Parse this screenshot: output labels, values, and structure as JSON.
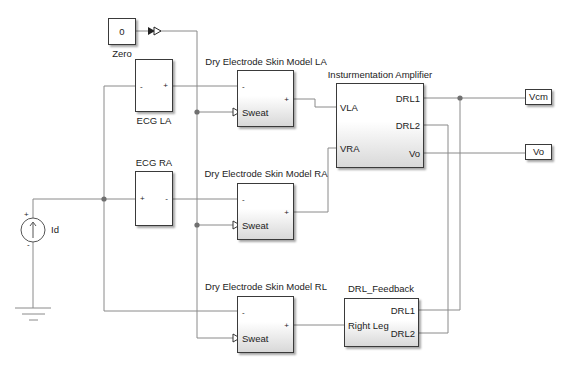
{
  "blocks": {
    "zero": {
      "value": "0",
      "label": "Zero"
    },
    "ecg_la": {
      "label": "ECG LA",
      "port_left": "-",
      "port_right": "+"
    },
    "ecg_ra": {
      "label": "ECG RA",
      "port_left": "+",
      "port_right": "-"
    },
    "dry_la": {
      "label": "Dry Electrode Skin Model LA",
      "port_minus": "-",
      "port_plus": "+",
      "port_sweat": "Sweat"
    },
    "dry_ra": {
      "label": "Dry Electrode Skin Model RA",
      "port_minus": "-",
      "port_plus": "+",
      "port_sweat": "Sweat"
    },
    "dry_rl": {
      "label": "Dry Electrode Skin Model RL",
      "port_minus": "-",
      "port_plus": "+",
      "port_sweat": "Sweat"
    },
    "amp": {
      "label": "Insturmentation Amplifier",
      "ports": {
        "vla": "VLA",
        "vra": "VRA",
        "drl1": "DRL1",
        "drl2": "DRL2",
        "vo": "Vo"
      }
    },
    "drl_feedback": {
      "label": "DRL_Feedback",
      "ports": {
        "right_leg": "Right Leg",
        "drl1": "DRL1",
        "drl2": "DRL2"
      }
    },
    "vcm_out": {
      "label": "Vcm"
    },
    "vo_out": {
      "label": "Vo"
    },
    "current_source": {
      "label": "Id",
      "plus": "+",
      "minus": "-"
    }
  },
  "colors": {
    "wire": "#8a8a8a",
    "block_border": "#3a3a3a",
    "junction": "#707070"
  }
}
